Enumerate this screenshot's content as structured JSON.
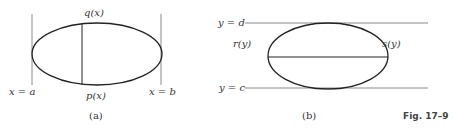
{
  "panel_a": {
    "caption": "(a)",
    "top_curve_label": "q(x)",
    "bottom_curve_label": "p(x)",
    "left_bound_label": "x = a",
    "right_bound_label": "x = b"
  },
  "panel_b": {
    "caption": "(b)",
    "top_bound_label": "y = d",
    "bottom_bound_label": "y = c",
    "left_curve_label": "r(y)",
    "right_curve_label": "s(y)"
  },
  "figure": {
    "label": "Fig. 17–9"
  },
  "colors": {
    "curve": "#222222",
    "boundary": "#8a8a8a",
    "text": "#333333"
  }
}
